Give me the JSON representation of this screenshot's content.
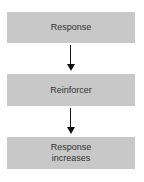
{
  "diagram": {
    "nodes": [
      {
        "id": "response",
        "label": "Response"
      },
      {
        "id": "reinforcer",
        "label": "Reinforcer"
      },
      {
        "id": "response-increases",
        "label_line1": "Response",
        "label_line2": "increases"
      }
    ],
    "edges": [
      {
        "from": "response",
        "to": "reinforcer"
      },
      {
        "from": "reinforcer",
        "to": "response-increases"
      }
    ],
    "colors": {
      "box": "#c8c8c8",
      "arrow": "#111111",
      "text": "#333333"
    }
  }
}
